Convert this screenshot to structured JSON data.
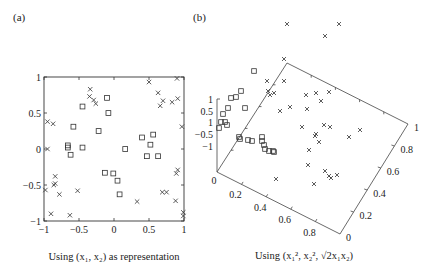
{
  "figure": {
    "panel_a_label": "(a)",
    "panel_b_label": "(b)",
    "caption_a": "Using (x₁, x₂) as representation",
    "caption_b": "Using (x₁², x₂², √2x₁x₂)"
  },
  "chart_data": [
    {
      "type": "scatter",
      "panel": "(a)",
      "title": "",
      "xlabel": "Using (x1, x2) as representation",
      "ylabel": "",
      "xlim": [
        -1,
        1
      ],
      "ylim": [
        -1,
        1
      ],
      "xticks": [
        -1,
        -0.5,
        0,
        0.5,
        1
      ],
      "yticks": [
        -1,
        -0.5,
        0,
        0.5,
        1
      ],
      "xtick_labels": [
        "−1",
        "−0.5",
        "0",
        "0.5",
        "1"
      ],
      "ytick_labels": [
        "−1",
        "−0.5",
        "0",
        "0.5",
        "1"
      ],
      "grid": false,
      "legend": null,
      "series": [
        {
          "name": "class x (cross)",
          "marker": "x",
          "points": [
            [
              -0.34,
              0.83
            ],
            [
              -0.35,
              0.73
            ],
            [
              -0.29,
              0.68
            ],
            [
              -0.26,
              0.63
            ],
            [
              0.5,
              0.93
            ],
            [
              0.9,
              0.98
            ],
            [
              0.63,
              0.78
            ],
            [
              0.66,
              0.6
            ],
            [
              0.7,
              0.67
            ],
            [
              0.83,
              0.65
            ],
            [
              0.91,
              0.7
            ],
            [
              -0.95,
              0.38
            ],
            [
              -0.87,
              0.35
            ],
            [
              0.97,
              0.31
            ],
            [
              -0.95,
              0.0
            ],
            [
              -0.84,
              -0.38
            ],
            [
              -0.84,
              -0.48
            ],
            [
              -0.86,
              -0.5
            ],
            [
              -0.98,
              -0.57
            ],
            [
              -0.78,
              -0.63
            ],
            [
              -0.52,
              -0.58
            ],
            [
              0.33,
              -0.73
            ],
            [
              0.69,
              -0.6
            ],
            [
              0.75,
              -0.6
            ],
            [
              0.89,
              -0.34
            ],
            [
              0.91,
              -0.29
            ],
            [
              0.88,
              -0.72
            ],
            [
              -0.9,
              -0.9
            ],
            [
              -0.63,
              -0.92
            ],
            [
              0.99,
              -0.88
            ],
            [
              0.99,
              -0.93
            ]
          ]
        },
        {
          "name": "class □ (square)",
          "marker": "square",
          "points": [
            [
              -0.1,
              0.71
            ],
            [
              -0.08,
              0.5
            ],
            [
              -0.45,
              0.59
            ],
            [
              -0.58,
              0.31
            ],
            [
              -0.22,
              0.25
            ],
            [
              0.4,
              0.16
            ],
            [
              0.56,
              0.2
            ],
            [
              0.52,
              0.06
            ],
            [
              -0.66,
              0.05
            ],
            [
              -0.66,
              0.02
            ],
            [
              -0.45,
              0.02
            ],
            [
              -0.62,
              -0.08
            ],
            [
              0.16,
              0.0
            ],
            [
              0.47,
              -0.1
            ],
            [
              0.63,
              -0.1
            ],
            [
              -0.13,
              -0.33
            ],
            [
              -0.01,
              -0.34
            ],
            [
              0.05,
              -0.44
            ],
            [
              0.08,
              -0.63
            ]
          ]
        }
      ]
    },
    {
      "type": "scatter",
      "panel": "(b)",
      "projection": "3d",
      "title": "",
      "xlabel": "Using (x1^2, x2^2, sqrt(2) x1 x2)",
      "axes": {
        "x": {
          "name": "x1^2",
          "ticks": [
            0,
            0.2,
            0.4,
            0.6,
            0.8,
            1
          ],
          "tick_labels": [
            "0",
            "0.2",
            "0.4",
            "0.6",
            "0.8",
            ""
          ]
        },
        "y": {
          "name": "x2^2",
          "ticks": [
            0,
            0.2,
            0.4,
            0.6,
            0.8,
            1
          ],
          "tick_labels": [
            "0",
            "0.2",
            "0.4",
            "0.6",
            "0.8",
            "1"
          ]
        },
        "z": {
          "name": "sqrt(2) x1 x2",
          "ticks": [
            -1,
            -0.5,
            0,
            0.5,
            1
          ],
          "tick_labels": [
            "−1",
            "−0.5",
            "1",
            "0.5",
            "1"
          ]
        }
      },
      "grid": false,
      "legend": null,
      "note": "3D projected view; points listed as screen-projected positions (px) since depth is not recoverable",
      "series": [
        {
          "name": "class x (cross)",
          "marker": "x",
          "screen_points": [
            [
              287,
              24
            ],
            [
              339,
              24
            ],
            [
              325,
              36
            ],
            [
              284,
              59
            ],
            [
              267,
              81
            ],
            [
              284,
              81
            ],
            [
              268,
              91
            ],
            [
              274,
              93
            ],
            [
              270,
              95
            ],
            [
              306,
              95
            ],
            [
              316,
              93
            ],
            [
              329,
              92
            ],
            [
              321,
              101
            ],
            [
              280,
              111
            ],
            [
              290,
              107
            ],
            [
              307,
              109
            ],
            [
              302,
              127
            ],
            [
              324,
              125
            ],
            [
              330,
              127
            ],
            [
              360,
              130
            ],
            [
              316,
              134
            ],
            [
              349,
              137
            ],
            [
              315,
              136
            ],
            [
              319,
              142
            ],
            [
              309,
              150
            ],
            [
              308,
              165
            ],
            [
              325,
              171
            ],
            [
              329,
              176
            ],
            [
              331,
              178
            ],
            [
              337,
              175
            ],
            [
              314,
              184
            ],
            [
              276,
              179
            ]
          ]
        },
        {
          "name": "class □ (square)",
          "marker": "square",
          "screen_points": [
            [
              254,
              71
            ],
            [
              241,
              91
            ],
            [
              236,
              97
            ],
            [
              231,
              98
            ],
            [
              228,
              108
            ],
            [
              223,
              114
            ],
            [
              225,
              122
            ],
            [
              221,
              122
            ],
            [
              227,
              125
            ],
            [
              219,
              128
            ],
            [
              245,
              108
            ],
            [
              239,
              137
            ],
            [
              240,
              139
            ],
            [
              248,
              140
            ],
            [
              252,
              141
            ],
            [
              262,
              137
            ],
            [
              262,
              141
            ],
            [
              264,
              145
            ],
            [
              265,
              149
            ],
            [
              269,
              151
            ],
            [
              273,
              151
            ],
            [
              274,
              152
            ]
          ]
        }
      ]
    }
  ]
}
